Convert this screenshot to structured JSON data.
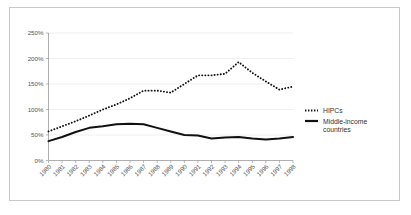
{
  "chart_data": {
    "type": "line",
    "title": "",
    "subtitle": "",
    "xlabel": "",
    "ylabel": "",
    "grid": true,
    "legend_position": "right",
    "ylim": [
      0,
      250
    ],
    "ytick_values": [
      0,
      50,
      100,
      150,
      200,
      250
    ],
    "ytick_labels": [
      "0%",
      "50%",
      "100%",
      "150%",
      "200%",
      "250%"
    ],
    "categories": [
      "1980",
      "1981",
      "1982",
      "1983",
      "1984",
      "1985",
      "1986",
      "1987",
      "1988",
      "1989",
      "1990",
      "1991",
      "1992",
      "1993",
      "1994",
      "1995",
      "1996",
      "1997",
      "1998"
    ],
    "series": [
      {
        "name": "HIPCs",
        "style": "dotted",
        "color": "#111111",
        "values": [
          57,
          67,
          77,
          88,
          100,
          110,
          122,
          137,
          137,
          133,
          150,
          167,
          167,
          170,
          193,
          172,
          155,
          139,
          145
        ]
      },
      {
        "name": "Middle-income countries",
        "style": "solid",
        "color": "#111111",
        "values": [
          38,
          46,
          56,
          64,
          67,
          71,
          72,
          71,
          64,
          57,
          50,
          49,
          43,
          45,
          46,
          43,
          41,
          43,
          46
        ]
      }
    ]
  },
  "legend": {
    "entries": [
      {
        "label": "HIPCs",
        "marker": "dotted-line-swatch"
      },
      {
        "label": "Middle-income",
        "label_line2": "countries",
        "marker": "solid-line-swatch"
      }
    ]
  },
  "axis": {
    "y": {
      "labels": [
        "250%",
        "200%",
        "150%",
        "100%",
        "50%",
        "0%"
      ]
    },
    "x": {
      "labels": [
        "1980",
        "1981",
        "1982",
        "1983",
        "1984",
        "1985",
        "1986",
        "1987",
        "1988",
        "1989",
        "1990",
        "1991",
        "1992",
        "1993",
        "1994",
        "1995",
        "1996",
        "1997",
        "1998"
      ]
    }
  }
}
